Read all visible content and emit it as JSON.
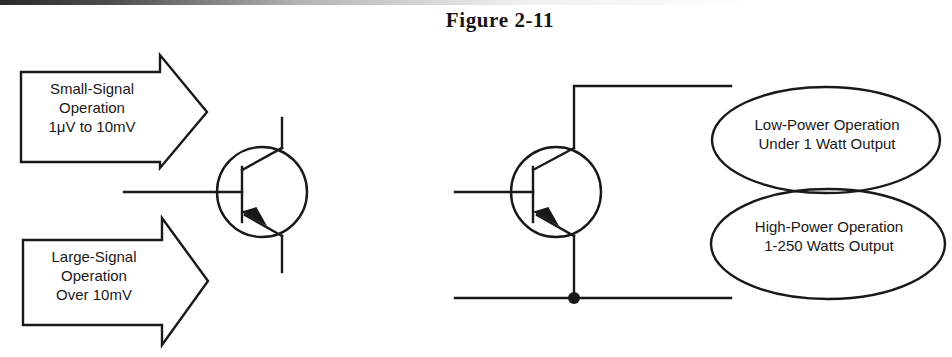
{
  "figure": {
    "title": "Figure 2-11",
    "ink_color": "#1b1818",
    "background_color": "#ffffff"
  },
  "left_diagram": {
    "name": "signal-level-transistor",
    "device": "pnp-transistor",
    "callouts": [
      {
        "id": "small-signal",
        "shape": "block-arrow-right",
        "lines": [
          "Small-Signal",
          "Operation",
          "1μV to 10mV"
        ]
      },
      {
        "id": "large-signal",
        "shape": "block-arrow-right",
        "lines": [
          "Large-Signal",
          "Operation",
          "Over 10mV"
        ]
      }
    ]
  },
  "right_diagram": {
    "name": "power-level-transistor",
    "device": "pnp-transistor",
    "has_junction_dot": true,
    "callouts": [
      {
        "id": "low-power",
        "shape": "ellipse",
        "lines": [
          "Low-Power Operation",
          "Under 1 Watt Output"
        ]
      },
      {
        "id": "high-power",
        "shape": "ellipse",
        "lines": [
          "High-Power Operation",
          "1-250 Watts Output"
        ]
      }
    ]
  }
}
